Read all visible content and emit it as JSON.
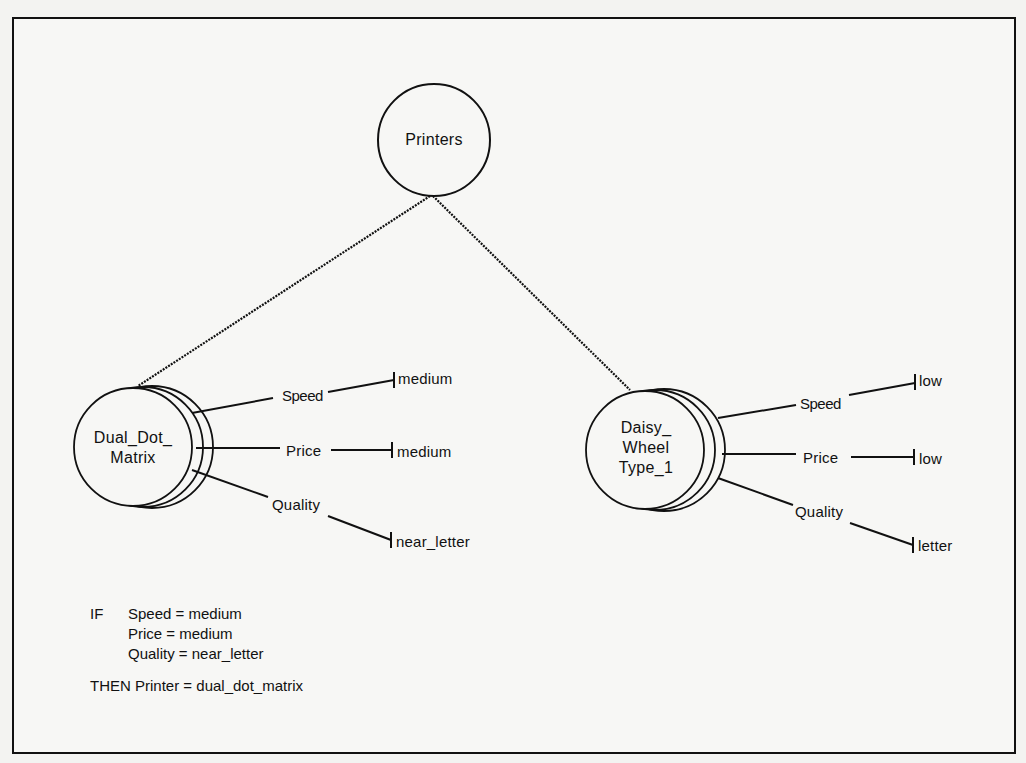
{
  "diagram": {
    "root": {
      "label": "Printers"
    },
    "nodes": [
      {
        "id": "dual_dot_matrix",
        "label_lines": [
          "Dual_Dot_",
          "Matrix"
        ],
        "attributes": [
          {
            "name": "Speed",
            "value": "medium"
          },
          {
            "name": "Price",
            "value": "medium"
          },
          {
            "name": "Quality",
            "value": "near_letter"
          }
        ]
      },
      {
        "id": "daisy_wheel_type_1",
        "label_lines": [
          "Daisy_",
          "Wheel",
          "Type_1"
        ],
        "attributes": [
          {
            "name": "Speed",
            "value": "low"
          },
          {
            "name": "Price",
            "value": "low"
          },
          {
            "name": "Quality",
            "value": "letter"
          }
        ]
      }
    ],
    "edges": [
      {
        "from": "Printers",
        "to": "Dual_Dot_Matrix"
      },
      {
        "from": "Printers",
        "to": "Daisy_Wheel_Type_1"
      }
    ]
  },
  "rule": {
    "if_keyword": "IF",
    "conditions": [
      {
        "text": "Speed = medium"
      },
      {
        "text": "Price = medium"
      },
      {
        "text": "Quality = near_letter"
      }
    ],
    "then_keyword": "THEN",
    "conclusion": "Printer = dual_dot_matrix"
  },
  "colors": {
    "ink": "#111111",
    "paper": "#f7f7f5"
  }
}
